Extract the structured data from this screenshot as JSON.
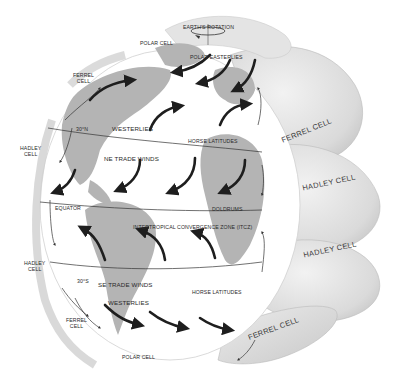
{
  "diagram": {
    "colors": {
      "background": "#ffffff",
      "globe_ocean": "#ffffff",
      "land": "#b4b4b4",
      "cells": "#dcdcdc",
      "arrows": "#1e1e1e",
      "lines": "#333333"
    },
    "top": {
      "earths_rotation": "EARTH'S ROTATION",
      "polar_cell_north": "POLAR CELL",
      "polar_easterlies": "POLAR EASTERLIES"
    },
    "left": {
      "ferrel_cell_north": [
        "FERREL",
        "CELL"
      ],
      "hadley_cell_north": [
        "HADLEY",
        "CELL"
      ],
      "hadley_cell_south": [
        "HADLEY",
        "CELL"
      ],
      "ferrel_cell_south": [
        "FERREL",
        "CELL"
      ],
      "polar_cell_south": "POLAR CELL"
    },
    "globe": {
      "lat_30n": "30°N",
      "westerlies_north": "WESTERLIES",
      "horse_latitudes_north": "HORSE LATITUDES",
      "ne_trade_winds": "NE TRADE WINDS",
      "equator": "EQUATOR",
      "doldrums": "DOLDRUMS",
      "itcz": "INTERTROPICAL CONVERGENCE ZONE (ITCZ)",
      "lat_30s": "30°S",
      "se_trade_winds": "SE TRADE WINDS",
      "horse_latitudes_south": "HORSE LATITUDES",
      "westerlies_south": "WESTERLIES"
    },
    "right_cells": {
      "ferrel_cell_north": "FERREL CELL",
      "hadley_cell_north": "HADLEY CELL",
      "hadley_cell_south": "HADLEY CELL",
      "ferrel_cell_south": "FERREL CELL"
    }
  }
}
